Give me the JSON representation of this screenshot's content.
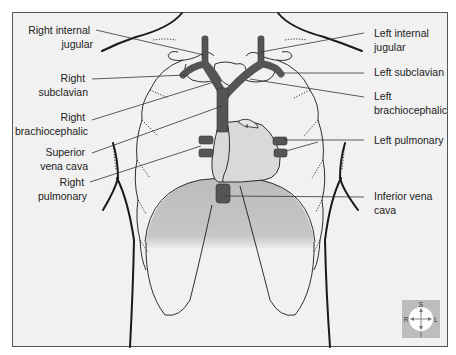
{
  "diagram": {
    "colors": {
      "background": "#f1f1f1",
      "frame_border": "#555555",
      "vein": "#555555",
      "heart_fill": "#d9d9d9",
      "diaphragm_shade": "#bdbdbd",
      "compass_bg": "#bdbdbd",
      "compass_disc": "#ffffff"
    },
    "labels_right_side": [
      {
        "id": "right-internal-jugular",
        "line1": "Right internal",
        "line2": "jugular"
      },
      {
        "id": "right-subclavian",
        "line1": "Right",
        "line2": "subclavian"
      },
      {
        "id": "right-brachiocephalic",
        "line1": "Right",
        "line2": "brachiocephalic"
      },
      {
        "id": "superior-vena-cava",
        "line1": "Superior",
        "line2": "vena cava"
      },
      {
        "id": "right-pulmonary",
        "line1": "Right",
        "line2": "pulmonary"
      }
    ],
    "labels_left_side": [
      {
        "id": "left-internal-jugular",
        "line1": "Left internal",
        "line2": "jugular"
      },
      {
        "id": "left-subclavian",
        "line1": "Left subclavian",
        "line2": ""
      },
      {
        "id": "left-brachiocephalic",
        "line1": "Left",
        "line2": "brachiocephalic"
      },
      {
        "id": "left-pulmonary",
        "line1": "Left pulmonary",
        "line2": ""
      },
      {
        "id": "inferior-vena-cava",
        "line1": "Inferior vena",
        "line2": "cava"
      }
    ],
    "compass": {
      "superior": "S",
      "inferior": "I",
      "right": "R",
      "left": "L"
    }
  }
}
